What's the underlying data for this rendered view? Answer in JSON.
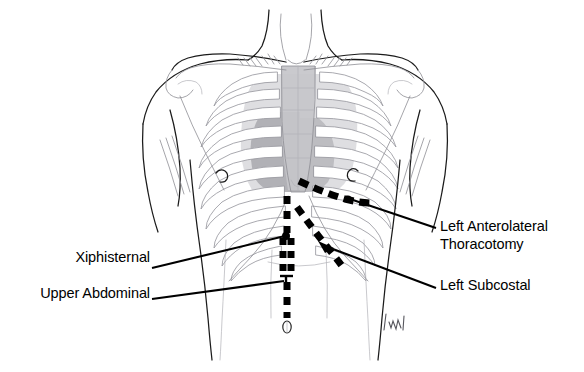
{
  "figure": {
    "background_color": "#ffffff",
    "line_color": "#1b1b1b",
    "incision_color": "#000000"
  },
  "labels": {
    "thoracotomy": {
      "line1": "Left Anterolateral",
      "line2": "Thoracotomy",
      "side": "right"
    },
    "subcostal": {
      "line1": "Left Subcostal",
      "side": "right"
    },
    "xiphisternal": {
      "line1": "Xiphisternal",
      "side": "left"
    },
    "upper_abdominal": {
      "line1": "Upper Abdominal",
      "side": "left"
    }
  },
  "incisions": [
    {
      "name": "left-anterolateral-thoracotomy",
      "style": "dashed",
      "orientation": "curved-oblique",
      "description": "Curved dashed line running across the left lower chest below the nipple line toward the lateral chest wall"
    },
    {
      "name": "left-subcostal",
      "style": "dashed",
      "orientation": "oblique",
      "description": "Oblique dashed line descending from the midline below the xiphisternum toward the left costal margin"
    },
    {
      "name": "midline-vertical",
      "style": "dashed",
      "orientation": "vertical",
      "description": "Vertical midline dashed line from the xiphisternum down past the umbilicus"
    }
  ],
  "shading": {
    "lung_field": "#d9d9dc",
    "sternum": "#c2c2c6",
    "cardiac_shadow": "#a9a9ae"
  },
  "annotations": {
    "umbilicus": "umbilicus",
    "nipple_left": "nipple",
    "nipple_right": "nipple",
    "artist_signature": "artist signature mark"
  }
}
